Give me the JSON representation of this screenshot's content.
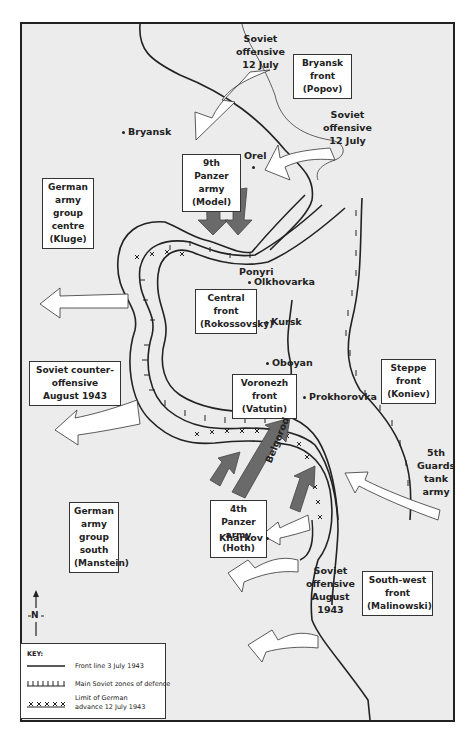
{
  "map": {
    "title": "Battle of Kursk, July–August 1943",
    "labels": {
      "soviet_offensive_north": [
        "Soviet",
        "offensive",
        "12 July"
      ],
      "soviet_offensive_east": [
        "Soviet",
        "offensive",
        "12 July"
      ],
      "soviet_offensive_august": [
        "Soviet",
        "offensive",
        "August",
        "1943"
      ],
      "guards_tank_army": [
        "5th",
        "Guards",
        "tank",
        "army"
      ],
      "belgorod": "Belgorod",
      "ponyri": "Ponyri"
    },
    "boxes": {
      "bryansk_front": [
        "Bryansk front",
        "(Popov)"
      ],
      "ninth_panzer": [
        "9th Panzer",
        "army (Model)"
      ],
      "army_group_centre": [
        "German",
        "army group",
        "centre",
        "(Kluge)"
      ],
      "central_front": [
        "Central",
        "front",
        "(Rokossovsky)"
      ],
      "counter_offensive": [
        "Soviet counter-",
        "offensive August 1943"
      ],
      "voronezh_front": [
        "Voronezh front",
        "(Vatutin)"
      ],
      "steppe_front": [
        "Steppe front",
        "(Koniev)"
      ],
      "army_group_south": [
        "German",
        "army group",
        "south",
        "(Manstein)"
      ],
      "fourth_panzer": [
        "4th Panzer",
        "army (Hoth)"
      ],
      "southwest_front": [
        "South-west front",
        "(Malinowski)"
      ]
    },
    "cities": {
      "bryansk": "Bryansk",
      "orel": "Orel",
      "olkhovarka": "Olkhovarka",
      "kursk": "Kursk",
      "oboyan": "Oboyan",
      "prokhorovka": "Prokhorovka",
      "kharkov": "Kharkov"
    },
    "compass": "N",
    "key": {
      "title": "KEY:",
      "items": [
        {
          "symbol": "solid-line",
          "label": "Front line 3 July 1943"
        },
        {
          "symbol": "tick-line",
          "label": "Main Soviet zones of defence"
        },
        {
          "symbol": "x-line",
          "label": "Limit of German",
          "label2": "advance 12 July 1943"
        }
      ]
    },
    "colors": {
      "background": "#ececec",
      "german_arrow": "#6a6a6a",
      "soviet_arrow": "#ffffff",
      "line": "#222222"
    }
  }
}
